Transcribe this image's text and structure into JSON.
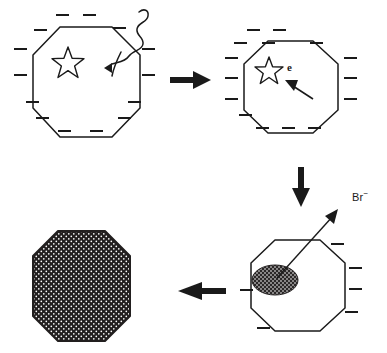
{
  "figure": {
    "background_color": "#ffffff",
    "stroke_color": "#1a1a1a",
    "fill_color": "#221f1f",
    "width": 387,
    "height": 353
  },
  "panels": [
    {
      "id": "panel-1",
      "position": "top-left",
      "shape": "octagon",
      "shape_fill": "none",
      "center": [
        86,
        82
      ],
      "radius": 57,
      "interior_marks": [
        {
          "name": "star",
          "type": "star-outline",
          "center": [
            68,
            62
          ],
          "radius": 15
        }
      ],
      "incoming": {
        "name": "excitation-squiggle",
        "type": "wavy-arrow",
        "description": "squiggly line entering octagon with arrowhead",
        "arrowhead_at": [
          105,
          66
        ]
      },
      "charge_symbol": "minus",
      "charge_count": 16
    },
    {
      "id": "panel-2",
      "position": "top-right",
      "shape": "octagon",
      "shape_fill": "none",
      "center": [
        289,
        87
      ],
      "radius": 50,
      "interior_marks": [
        {
          "name": "star",
          "type": "star-outline",
          "center": [
            269,
            70
          ],
          "radius": 13
        }
      ],
      "label": "e",
      "label_position": [
        289,
        68
      ],
      "incoming": {
        "name": "electron-arrow",
        "type": "straight-arrow",
        "description": "arrow pointing up-left toward octagon interior",
        "from": [
          311,
          98
        ],
        "to": [
          286,
          81
        ]
      },
      "charge_symbol": "minus",
      "charge_count": 16
    },
    {
      "id": "panel-3",
      "position": "bottom-right",
      "shape": "octagon",
      "shape_fill": "none",
      "center": [
        297,
        285
      ],
      "radius": 50,
      "interior_marks": [
        {
          "name": "charged-domain",
          "type": "hatched-ellipse",
          "center": [
            275,
            280
          ],
          "rx": 23,
          "ry": 15
        }
      ],
      "outgoing": {
        "name": "bromide-release-arrow",
        "type": "thin-arrow",
        "from": [
          277,
          279
        ],
        "to": [
          337,
          212
        ]
      },
      "label": "Br",
      "label_superscript": "−",
      "label_position": [
        352,
        192
      ],
      "charge_symbol": "minus",
      "charge_count": 6
    },
    {
      "id": "panel-4",
      "position": "bottom-left",
      "shape": "octagon",
      "shape_fill": "dark-cross-hatch",
      "center": [
        81,
        286
      ],
      "radius": 56,
      "interior_marks": [],
      "charge_symbol": "minus",
      "charge_count": 0
    }
  ],
  "connectors": [
    {
      "name": "arrow-step-1-to-2",
      "type": "block-arrow",
      "direction": "right",
      "from": [
        172,
        80
      ],
      "to": [
        210,
        80
      ]
    },
    {
      "name": "arrow-step-2-to-3",
      "type": "block-arrow",
      "direction": "down",
      "from": [
        301,
        168
      ],
      "to": [
        301,
        207
      ]
    },
    {
      "name": "arrow-step-3-to-4",
      "type": "block-arrow",
      "direction": "left",
      "from": [
        222,
        291
      ],
      "to": [
        178,
        291
      ]
    }
  ],
  "charges": {
    "panel-1": [
      [
        62,
        27
      ],
      [
        88,
        27
      ],
      [
        38,
        120
      ],
      [
        62,
        130
      ],
      [
        94,
        130
      ],
      [
        36,
        33
      ],
      [
        16,
        45
      ],
      [
        16,
        64
      ],
      [
        28,
        108
      ],
      [
        117,
        30
      ],
      [
        147,
        45
      ],
      [
        147,
        62
      ],
      [
        130,
        110
      ],
      [
        113,
        120
      ],
      [
        16,
        83
      ],
      [
        147,
        80
      ]
    ],
    "panel-2": [
      [
        253,
        32
      ],
      [
        279,
        32
      ],
      [
        240,
        43
      ],
      [
        268,
        43
      ],
      [
        316,
        43
      ],
      [
        230,
        57
      ],
      [
        230,
        75
      ],
      [
        230,
        95
      ],
      [
        338,
        57
      ],
      [
        338,
        75
      ],
      [
        338,
        95
      ],
      [
        245,
        113
      ],
      [
        262,
        123
      ],
      [
        288,
        123
      ],
      [
        314,
        123
      ],
      [
        303,
        32
      ]
    ],
    "panel-3": [
      [
        337,
        244
      ],
      [
        342,
        268
      ],
      [
        342,
        289
      ],
      [
        338,
        313
      ],
      [
        263,
        328
      ],
      [
        246,
        293
      ]
    ]
  }
}
